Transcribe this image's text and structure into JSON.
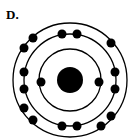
{
  "label": "D.",
  "diagram": {
    "type": "bohr-model",
    "center": [
      70,
      80
    ],
    "nucleus_radius": 13,
    "color": "#000000",
    "shells": [
      {
        "radius": 31,
        "electrons": [
          [
            41,
            82
          ],
          [
            99,
            82
          ]
        ]
      },
      {
        "radius": 46,
        "electrons": [
          [
            62,
            34
          ],
          [
            77,
            34
          ],
          [
            24,
            72
          ],
          [
            24,
            89
          ],
          [
            115,
            72
          ],
          [
            115,
            89
          ],
          [
            62,
            126
          ],
          [
            77,
            126
          ]
        ]
      },
      {
        "radius": 57,
        "electrons": [
          [
            33,
            38
          ],
          [
            24,
            48
          ],
          [
            111,
            43
          ],
          [
            24,
            108
          ],
          [
            33,
            120
          ],
          [
            111,
            116
          ],
          [
            101,
            126
          ]
        ]
      }
    ]
  }
}
